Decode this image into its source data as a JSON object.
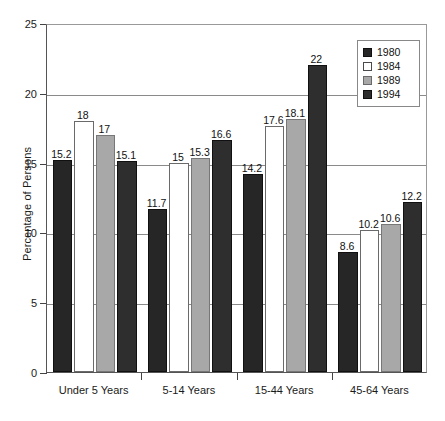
{
  "chart_data": {
    "type": "bar",
    "title": "",
    "subtitle": "",
    "xlabel": "",
    "ylabel": "Percentage of Persons",
    "ylim": [
      0,
      25
    ],
    "yticks": [
      0,
      5,
      10,
      15,
      20,
      25
    ],
    "ytick_labels": [
      "0",
      "5",
      "10",
      "15",
      "20",
      "25"
    ],
    "grid": true,
    "grid_axis": "y",
    "legend_position": "upper-right",
    "categories": [
      "Under 5 Years",
      "5-14 Years",
      "15-44 Years",
      "45-64 Years"
    ],
    "series": [
      {
        "name": "1980",
        "color": "#262626",
        "values": [
          15.2,
          11.7,
          14.2,
          8.6
        ],
        "labels": [
          "15.2",
          "11.7",
          "14.2",
          "8.6"
        ]
      },
      {
        "name": "1984",
        "color": "#ffffff",
        "values": [
          18,
          15,
          17.6,
          10.2
        ],
        "labels": [
          "18",
          "15",
          "17.6",
          "10.2"
        ]
      },
      {
        "name": "1989",
        "color": "#a8a8a8",
        "values": [
          17,
          15.3,
          18.1,
          10.6
        ],
        "labels": [
          "17",
          "15.3",
          "18.1",
          "10.6"
        ]
      },
      {
        "name": "1994",
        "color": "#2e2e2e",
        "values": [
          15.1,
          16.6,
          22,
          12.2
        ],
        "labels": [
          "15.1",
          "16.6",
          "22",
          "12.2"
        ]
      }
    ]
  },
  "legend": {
    "entries": [
      {
        "label": "1980"
      },
      {
        "label": "1984"
      },
      {
        "label": "1989"
      },
      {
        "label": "1994"
      }
    ]
  },
  "axes": {
    "y_title": "Percentage of Persons"
  }
}
